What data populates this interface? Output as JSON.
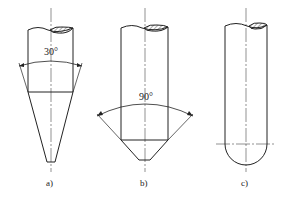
{
  "figures": [
    {
      "id": "a",
      "label": "a)",
      "angle_label": "30°",
      "tip_type": "conical-sharp"
    },
    {
      "id": "b",
      "label": "b)",
      "angle_label": "90°",
      "tip_type": "conical-blunt"
    },
    {
      "id": "c",
      "label": "c)",
      "tip_type": "spherical"
    }
  ],
  "colors": {
    "line": "#222222",
    "background": "#ffffff"
  }
}
